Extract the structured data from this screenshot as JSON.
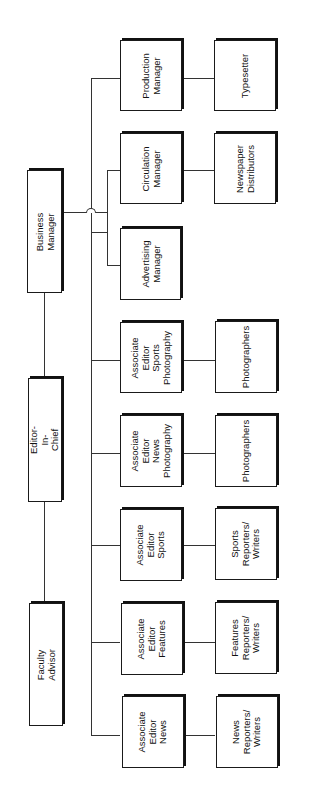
{
  "diagram": {
    "type": "org-chart",
    "orientation": "rotated-90-ccw",
    "nodes": {
      "faculty_advisor": "Faculty Advisor",
      "editor_in_chief": "Editor-In-Chief",
      "business_manager": "Business Manager",
      "production_manager": "Production\nManager",
      "typesetter": "Typesetter",
      "circulation_manager": "Circulation\nManager",
      "newspaper_distributors": "Newspaper\nDistributors",
      "advertising_manager": "Advertising\nManager",
      "assoc_sports_photography": "Associate\nEditor\nSports\nPhotography",
      "photographers_sports": "Photographers",
      "assoc_news_photography": "Associate\nEditor\nNews\nPhotography",
      "photographers_news": "Photographers",
      "assoc_sports": "Associate\nEditor\nSports",
      "sports_writers": "Sports\nReporters/\nWriters",
      "assoc_features": "Associate\nEditor\nFeatures",
      "features_writers": "Features\nReporters/\nWriters",
      "assoc_news": "Associate\nEditor\nNews",
      "news_writers": "News\nReporters/\nWriters"
    },
    "edges": [
      [
        "faculty_advisor",
        "editor_in_chief"
      ],
      [
        "editor_in_chief",
        "business_manager"
      ],
      [
        "business_manager",
        "circulation_manager"
      ],
      [
        "business_manager",
        "advertising_manager"
      ],
      [
        "editor_in_chief",
        "production_manager"
      ],
      [
        "editor_in_chief",
        "assoc_sports_photography"
      ],
      [
        "editor_in_chief",
        "assoc_news_photography"
      ],
      [
        "editor_in_chief",
        "assoc_sports"
      ],
      [
        "editor_in_chief",
        "assoc_features"
      ],
      [
        "editor_in_chief",
        "assoc_news"
      ],
      [
        "production_manager",
        "typesetter"
      ],
      [
        "circulation_manager",
        "newspaper_distributors"
      ],
      [
        "assoc_sports_photography",
        "photographers_sports"
      ],
      [
        "assoc_news_photography",
        "photographers_news"
      ],
      [
        "assoc_sports",
        "sports_writers"
      ],
      [
        "assoc_features",
        "features_writers"
      ],
      [
        "assoc_news",
        "news_writers"
      ]
    ]
  }
}
